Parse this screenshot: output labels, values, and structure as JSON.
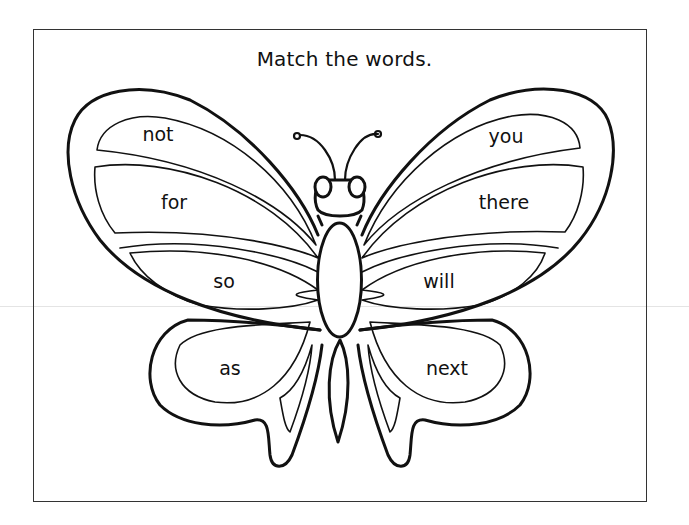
{
  "worksheet": {
    "title": "Match the words.",
    "left_words": [
      {
        "text": "not",
        "x": 158,
        "y": 134
      },
      {
        "text": "for",
        "x": 174,
        "y": 202
      },
      {
        "text": "so",
        "x": 224,
        "y": 281
      },
      {
        "text": "as",
        "x": 230,
        "y": 368
      }
    ],
    "right_words": [
      {
        "text": "you",
        "x": 506,
        "y": 136
      },
      {
        "text": "there",
        "x": 504,
        "y": 202
      },
      {
        "text": "will",
        "x": 439,
        "y": 281
      },
      {
        "text": "next",
        "x": 447,
        "y": 368
      }
    ],
    "colors": {
      "ink": "#111111",
      "frame": "#333333",
      "paper": "#ffffff"
    }
  }
}
